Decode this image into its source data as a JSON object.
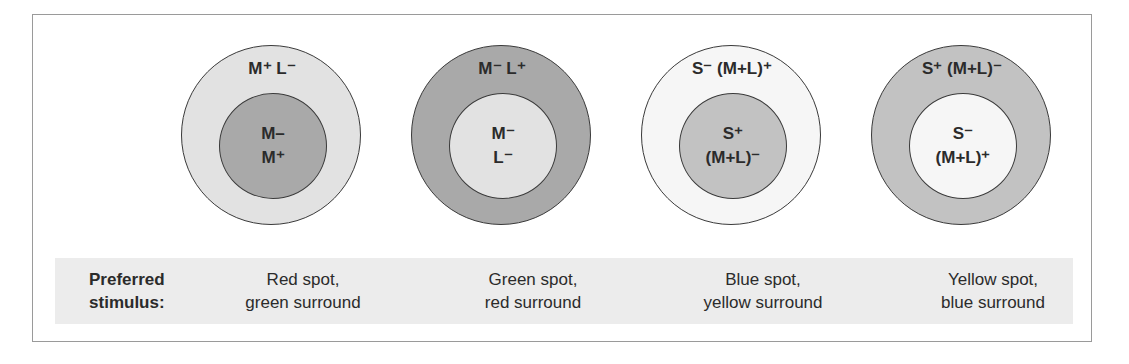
{
  "figure": {
    "cells": [
      {
        "outer_label": "M⁺ L⁻",
        "inner_lines": [
          "M–",
          "M⁺"
        ],
        "outer_color": "#e2e2e2",
        "inner_color": "#a9a9a9",
        "preferred_stimulus": [
          "Red spot,",
          "green surround"
        ]
      },
      {
        "outer_label": "M⁻ L⁺",
        "inner_lines": [
          "M⁻",
          "L⁻"
        ],
        "outer_color": "#a9a9a9",
        "inner_color": "#e2e2e2",
        "preferred_stimulus": [
          "Green spot,",
          "red surround"
        ]
      },
      {
        "outer_label": "S⁻ (M+L)⁺",
        "inner_lines": [
          "S⁺",
          "(M+L)⁻"
        ],
        "outer_color": "#f6f6f6",
        "inner_color": "#c2c2c2",
        "preferred_stimulus": [
          "Blue spot,",
          "yellow surround"
        ]
      },
      {
        "outer_label": "S⁺ (M+L)⁻",
        "inner_lines": [
          "S⁻",
          "(M+L)⁺"
        ],
        "outer_color": "#c2c2c2",
        "inner_color": "#f6f6f6",
        "preferred_stimulus": [
          "Yellow spot,",
          "blue surround"
        ]
      }
    ],
    "preferred_label": [
      "Preferred",
      "stimulus:"
    ],
    "band_color": "#ececec",
    "frame_color": "#9a9a9a",
    "stroke_color": "#3a3a3a"
  }
}
